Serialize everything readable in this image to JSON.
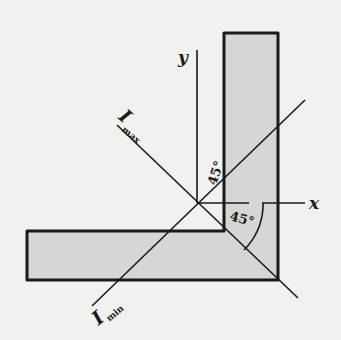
{
  "diagram": {
    "colors": {
      "background": "#f1f1ef",
      "section_fill": "#d6d6d4",
      "stroke": "#1a1a1a"
    },
    "axes": {
      "x_label": "x",
      "y_label": "y"
    },
    "principal_axes": {
      "max": {
        "symbol": "I",
        "subscript": "max"
      },
      "min": {
        "symbol": "I",
        "subscript": "min"
      }
    },
    "angles": {
      "upper": "45°",
      "lower": "45°"
    }
  }
}
